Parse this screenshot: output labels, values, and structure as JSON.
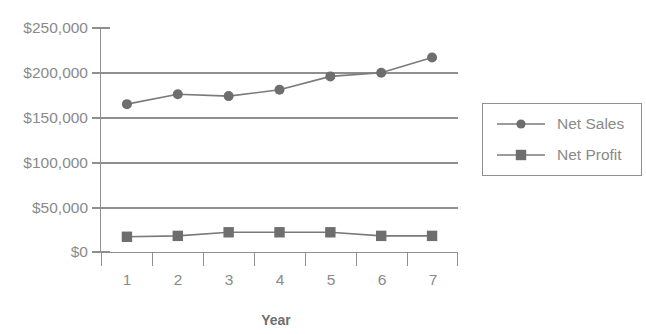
{
  "chart_data": {
    "type": "line",
    "title": "",
    "xlabel": "Year",
    "ylabel": "",
    "categories": [
      "1",
      "2",
      "3",
      "4",
      "5",
      "6",
      "7"
    ],
    "x": [
      1,
      2,
      3,
      4,
      5,
      6,
      7
    ],
    "series": [
      {
        "name": "Net Sales",
        "marker": "circle",
        "color": "#6e6e6e",
        "values": [
          165000,
          176000,
          174000,
          181000,
          196000,
          200000,
          217000
        ]
      },
      {
        "name": "Net Profit",
        "marker": "square",
        "color": "#6e6e6e",
        "values": [
          17000,
          18000,
          22000,
          22000,
          22000,
          18000,
          18000
        ]
      }
    ],
    "ylim": [
      0,
      250000
    ],
    "ytick_values": [
      0,
      50000,
      100000,
      150000,
      200000,
      250000
    ],
    "ytick_labels": [
      "$0",
      "$50,000",
      "$100,000",
      "$150,000",
      "$200,000",
      "$250,000"
    ],
    "grid": true,
    "grid_axis": "y",
    "legend_position": "right",
    "legend_entries": [
      "Net Sales",
      "Net Profit"
    ],
    "colors": {
      "line": "#7a7a7a",
      "marker": "#6e6e6e",
      "grid": "#8f8f8f",
      "axis": "#8f8f8f",
      "text": "#8a8a8a",
      "title_text": "#6f6f6f",
      "background": "#ffffff"
    }
  },
  "axis": {
    "y_labels": [
      {
        "text": "$250,000",
        "value": 250000
      },
      {
        "text": "$200,000",
        "value": 200000
      },
      {
        "text": "$150,000",
        "value": 150000
      },
      {
        "text": "$100,000",
        "value": 100000
      },
      {
        "text": "$50,000",
        "value": 50000
      },
      {
        "text": "$0",
        "value": 0
      }
    ],
    "x_labels": [
      "1",
      "2",
      "3",
      "4",
      "5",
      "6",
      "7"
    ],
    "x_title": "Year"
  },
  "legend": {
    "items": [
      {
        "label": "Net Sales",
        "marker": "circle-marker"
      },
      {
        "label": "Net Profit",
        "marker": "square-marker"
      }
    ]
  }
}
